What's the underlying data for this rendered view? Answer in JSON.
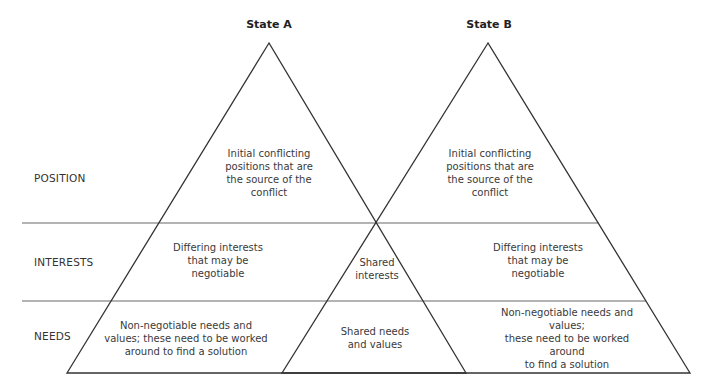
{
  "titles": {
    "state_a": "State A",
    "state_b": "State B"
  },
  "rows": {
    "position": "POSITION",
    "interests": "INTERESTS",
    "needs": "NEEDS"
  },
  "state_a": {
    "position": "Initial conflicting\npositions that are\nthe source of the\nconflict",
    "interests": "Differing interests\nthat may be\nnegotiable",
    "needs": "Non-negotiable needs and\nvalues; these need to be worked\naround to find a solution"
  },
  "shared": {
    "interests": "Shared\ninterests",
    "needs": "Shared needs\nand values"
  },
  "state_b": {
    "position": "Initial conflicting\npositions that are\nthe source of the\nconflict",
    "interests": "Differing interests\nthat may be\nnegotiable",
    "needs": "Non-negotiable needs and values;\nthese need to be worked around\nto find a solution"
  },
  "colors": {
    "triangle_stroke": "#333333",
    "divider_stroke": "#9a9a9a"
  }
}
